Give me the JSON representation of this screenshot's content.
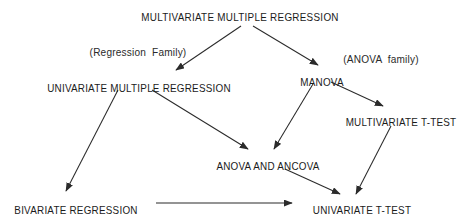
{
  "diagram": {
    "title": "MULTIVARIATE MULTIPLE REGRESSION",
    "background_color": "#ffffff",
    "line_color": "#2b2b2b",
    "text_color": "#1b1b1b",
    "nodes": [
      {
        "id": "multivariate-multiple-regression",
        "label": "MULTIVARIATE MULTIPLE REGRESSION",
        "x": 240,
        "y": 11
      },
      {
        "id": "univariate-multiple-regression",
        "label": "UNIVARIATE MULTIPLE REGRESSION",
        "x": 139,
        "y": 82
      },
      {
        "id": "manova",
        "label": "MANOVA",
        "x": 322,
        "y": 76
      },
      {
        "id": "multivariate-t-test",
        "label": "MULTIVARIATE T-TEST",
        "x": 401,
        "y": 116
      },
      {
        "id": "anova-and-ancova",
        "label": "ANOVA AND ANCOVA",
        "x": 268,
        "y": 160
      },
      {
        "id": "bivariate-regression",
        "label": "BIVARIATE REGRESSION",
        "x": 76,
        "y": 204
      },
      {
        "id": "univariate-t-test",
        "label": "UNIVARIATE T-TEST",
        "x": 362,
        "y": 204
      }
    ],
    "family_labels": [
      {
        "id": "regression-family",
        "label": "(Regression  Family)",
        "x": 138,
        "y": 46
      },
      {
        "id": "anova-family",
        "label": "(ANOVA  family)",
        "x": 381,
        "y": 53
      }
    ],
    "edges": [
      {
        "id": "edge-root-to-univariate-multiple-regression",
        "from": "multivariate-multiple-regression",
        "to": "univariate-multiple-regression",
        "x1": 241,
        "y1": 26,
        "x2": 176,
        "y2": 70
      },
      {
        "id": "edge-root-to-manova",
        "from": "multivariate-multiple-regression",
        "to": "manova",
        "x1": 253,
        "y1": 26,
        "x2": 318,
        "y2": 65
      },
      {
        "id": "edge-univariate-multiple-regression-to-bivariate-regression",
        "from": "univariate-multiple-regression",
        "to": "bivariate-regression",
        "x1": 118,
        "y1": 90,
        "x2": 66,
        "y2": 191
      },
      {
        "id": "edge-univariate-multiple-regression-to-anova-and-ancova",
        "from": "univariate-multiple-regression",
        "to": "anova-and-ancova",
        "x1": 152,
        "y1": 90,
        "x2": 248,
        "y2": 149
      },
      {
        "id": "edge-manova-to-multivariate-t-test",
        "from": "manova",
        "to": "multivariate-t-test",
        "x1": 331,
        "y1": 82,
        "x2": 383,
        "y2": 106
      },
      {
        "id": "edge-manova-to-anova-and-ancova",
        "from": "manova",
        "to": "anova-and-ancova",
        "x1": 313,
        "y1": 84,
        "x2": 274,
        "y2": 149
      },
      {
        "id": "edge-multivariate-t-test-to-univariate-t-test",
        "from": "multivariate-t-test",
        "to": "univariate-t-test",
        "x1": 391,
        "y1": 126,
        "x2": 356,
        "y2": 194
      },
      {
        "id": "edge-anova-and-ancova-to-univariate-t-test",
        "from": "anova-and-ancova",
        "to": "univariate-t-test",
        "x1": 285,
        "y1": 169,
        "x2": 340,
        "y2": 194
      },
      {
        "id": "edge-bivariate-regression-to-univariate-t-test",
        "from": "bivariate-regression",
        "to": "univariate-t-test",
        "x1": 156,
        "y1": 203,
        "x2": 292,
        "y2": 203
      }
    ]
  }
}
